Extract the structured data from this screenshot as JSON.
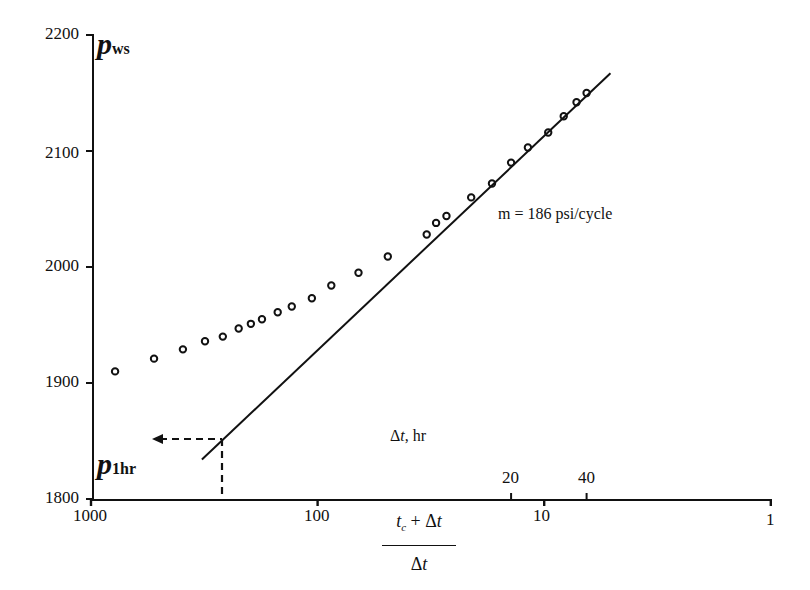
{
  "chart_data": {
    "type": "scatter",
    "title": "",
    "xlabel": "(t_c + Δt) / Δt",
    "ylabel": "p_ws",
    "x_scale": "log",
    "x_reversed": true,
    "xlim": [
      1000,
      1
    ],
    "ylim": [
      1800,
      2200
    ],
    "grid": false,
    "legend": null,
    "x_ticks": [
      {
        "value": 1000,
        "label": "1000"
      },
      {
        "value": 100,
        "label": "100"
      },
      {
        "value": 10,
        "label": "10"
      },
      {
        "value": 1,
        "label": "1"
      }
    ],
    "y_ticks": [
      {
        "value": 1800,
        "label": "1800"
      },
      {
        "value": 1900,
        "label": "1900"
      },
      {
        "value": 2000,
        "label": "2000"
      },
      {
        "value": 2100,
        "label": "2100"
      },
      {
        "value": 2200,
        "label": "2200"
      }
    ],
    "secondary_x_axis": {
      "label": "Δt, hr",
      "ticks": [
        {
          "label": "20",
          "horner_x": 14
        },
        {
          "label": "40",
          "horner_x": 6.5
        }
      ]
    },
    "series": [
      {
        "name": "p_ws data",
        "marker": "open-circle",
        "points": [
          {
            "x": 783,
            "y": 1910
          },
          {
            "x": 527,
            "y": 1921
          },
          {
            "x": 393,
            "y": 1929
          },
          {
            "x": 314,
            "y": 1936
          },
          {
            "x": 262,
            "y": 1940
          },
          {
            "x": 223,
            "y": 1947
          },
          {
            "x": 197,
            "y": 1951
          },
          {
            "x": 176,
            "y": 1955
          },
          {
            "x": 150,
            "y": 1961
          },
          {
            "x": 130,
            "y": 1966
          },
          {
            "x": 106,
            "y": 1973
          },
          {
            "x": 87,
            "y": 1984
          },
          {
            "x": 66,
            "y": 1995
          },
          {
            "x": 49,
            "y": 2009
          },
          {
            "x": 33,
            "y": 2028
          },
          {
            "x": 30,
            "y": 2038
          },
          {
            "x": 27,
            "y": 2044
          },
          {
            "x": 21,
            "y": 2060
          },
          {
            "x": 17,
            "y": 2072
          },
          {
            "x": 14,
            "y": 2090
          },
          {
            "x": 11.8,
            "y": 2103
          },
          {
            "x": 9.6,
            "y": 2116
          },
          {
            "x": 8.2,
            "y": 2130
          },
          {
            "x": 7.2,
            "y": 2142
          },
          {
            "x": 6.5,
            "y": 2150
          }
        ]
      },
      {
        "name": "semilog straight line",
        "type": "line",
        "points": [
          {
            "x": 324,
            "y": 1834
          },
          {
            "x": 5.1,
            "y": 2167
          }
        ]
      }
    ],
    "annotations": [
      {
        "text": "m = 186 psi/cycle",
        "kind": "slope-label"
      },
      {
        "text": "p_1hr",
        "value": 1852,
        "horner_x": 300,
        "kind": "dashed-extrapolation-arrow"
      },
      {
        "text": "Δt, hr",
        "kind": "secondary-axis-label"
      }
    ]
  },
  "labels": {
    "y_tick_2200": "2200",
    "y_tick_2100": "2100",
    "y_tick_2000": "2000",
    "y_tick_1900": "1900",
    "y_tick_1800": "1800",
    "x_tick_1000": "1000",
    "x_tick_100": "100",
    "x_tick_10": "10",
    "x_tick_1": "1",
    "dt_tick_20": "20",
    "dt_tick_40": "40",
    "pws_symbol": "p",
    "pws_sub": "ws",
    "p1hr_symbol": "p",
    "p1hr_sub": "1hr",
    "slope": "m = 186 psi/cycle",
    "dt_axis_symbol": "Δ",
    "dt_axis_t": "t",
    "dt_axis_unit": ", hr",
    "frac_tc": "t",
    "frac_c": "c",
    "frac_plus": " + Δ",
    "frac_t": "t",
    "frac_den_delta": "Δ",
    "frac_den_t": "t"
  }
}
